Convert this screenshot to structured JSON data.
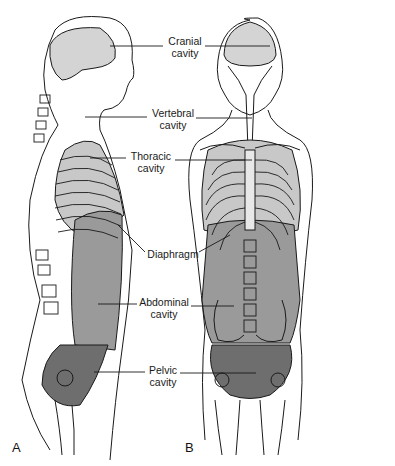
{
  "figure": {
    "panels": [
      {
        "id": "A",
        "letter": "A",
        "view": "lateral"
      },
      {
        "id": "B",
        "letter": "B",
        "view": "anterior"
      }
    ],
    "labels": {
      "cranial": "Cranial\ncavity",
      "vertebral": "Vertebral\ncavity",
      "thoracic": "Thoracic\ncavity",
      "diaphragm": "Diaphragm",
      "abdominal": "Abdominal\ncavity",
      "pelvic": "Pelvic\ncavity"
    },
    "colors": {
      "cranial": "#d4d4d4",
      "thoracic": "#c8c8c8",
      "abdominal": "#9a9a9a",
      "pelvic": "#6e6e6e",
      "outline": "#1a1a1a"
    }
  }
}
